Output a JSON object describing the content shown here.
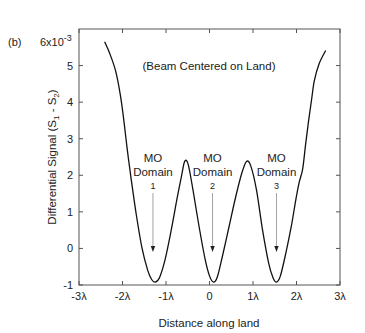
{
  "panel_label": "(b)",
  "chart_data": {
    "type": "line",
    "title": "",
    "annotation_title": "(Beam Centered on Land)",
    "xlabel": "Distance along land",
    "ylabel": "Differential Signal  (S1 - S2)",
    "ylabel_parts": {
      "main": "Differential Signal",
      "s": "S",
      "sub1": "1",
      "sub2": "2"
    },
    "y_multiplier": "6x10",
    "y_multiplier_exp": "-3",
    "xlim": [
      -3,
      3
    ],
    "ylim": [
      -1,
      6
    ],
    "x_ticks": [
      -3,
      -2,
      -1,
      0,
      1,
      2,
      3
    ],
    "x_tick_labels": [
      "-3λ",
      "-2λ",
      "-1λ",
      "0",
      "1λ",
      "2λ",
      "3λ"
    ],
    "y_ticks": [
      -1,
      0,
      1,
      2,
      3,
      4,
      5
    ],
    "y_tick_labels": [
      "-1",
      "0",
      "1",
      "2",
      "3",
      "4",
      "5"
    ],
    "grid": false,
    "legend": null,
    "series": [
      {
        "name": "Differential signal",
        "x": [
          -2.41,
          -2.3,
          -2.16,
          -2.05,
          -1.97,
          -1.89,
          -1.8,
          -1.68,
          -1.55,
          -1.42,
          -1.33,
          -1.25,
          -1.15,
          -1.02,
          -0.88,
          -0.74,
          -0.64,
          -0.57,
          -0.49,
          -0.38,
          -0.24,
          -0.1,
          0.0,
          0.09,
          0.18,
          0.3,
          0.45,
          0.6,
          0.74,
          0.85,
          0.95,
          1.08,
          1.22,
          1.36,
          1.46,
          1.54,
          1.63,
          1.76,
          1.88,
          1.98,
          2.06,
          2.14,
          2.21,
          2.28,
          2.35,
          2.41,
          2.52,
          2.67
        ],
        "y": [
          5.65,
          5.35,
          4.86,
          4.2,
          3.51,
          2.7,
          1.89,
          0.9,
          0.0,
          -0.6,
          -0.85,
          -0.92,
          -0.8,
          -0.3,
          0.5,
          1.4,
          2.0,
          2.38,
          2.3,
          1.6,
          0.6,
          -0.3,
          -0.75,
          -0.92,
          -0.78,
          -0.2,
          0.6,
          1.4,
          2.05,
          2.38,
          2.25,
          1.6,
          0.5,
          -0.4,
          -0.8,
          -0.92,
          -0.75,
          -0.1,
          0.6,
          1.3,
          1.8,
          2.16,
          2.85,
          3.51,
          4.1,
          4.59,
          5.05,
          5.41
        ]
      }
    ],
    "annotations": [
      {
        "lines": [
          "MO",
          "Domain",
          "1"
        ],
        "arrow_x": -1.3,
        "arrow_y_from": 1.9,
        "arrow_y_to": -0.1
      },
      {
        "lines": [
          "MO",
          "Domain",
          "2"
        ],
        "arrow_x": 0.07,
        "arrow_y_from": 1.9,
        "arrow_y_to": -0.1
      },
      {
        "lines": [
          "MO",
          "Domain",
          "3"
        ],
        "arrow_x": 1.54,
        "arrow_y_from": 1.9,
        "arrow_y_to": -0.1
      }
    ]
  }
}
